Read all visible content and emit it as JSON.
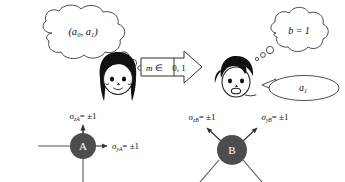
{
  "diagram": {
    "title_alt": "Quantum protocol diagram with Alice and Bob",
    "alice": {
      "name": "Alice",
      "thought_text": "(a₀, a₁)",
      "thought_main": "(a",
      "thought_sub0": "0",
      "thought_mid": ", a",
      "thought_sub1": "1",
      "thought_end": ")",
      "node_label": "A",
      "label_top_sym": "σ",
      "label_top_sub": "zA",
      "label_top_val": "= ±1",
      "label_right_sym": "σ",
      "label_right_sub": "yA",
      "label_right_val": "= ±1"
    },
    "bob": {
      "name": "Bob",
      "thought_main": "b = 1",
      "speech_main": "a",
      "speech_sub": "1",
      "node_label": "B",
      "label_left_sym": "σ",
      "label_left_sub": "zB",
      "label_left_val": "= ±1",
      "label_right_sym": "σ",
      "label_right_sub": "yB",
      "label_right_val": "= ±1"
    },
    "message": {
      "symbol": "m",
      "relation": "∈",
      "set": "0, 1",
      "full": "m ∈ {0, 1}"
    },
    "colors": {
      "node_fill": "#4d4d4d",
      "node_text": "#ffffff",
      "stroke": "#333333",
      "bubble_stroke": "#3a3a3a",
      "background": "#ffffff",
      "hair": "#111111"
    }
  }
}
